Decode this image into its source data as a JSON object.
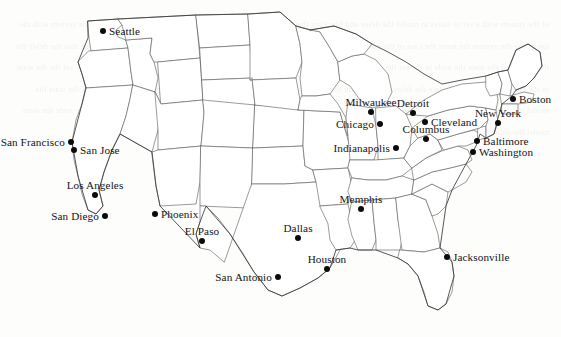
{
  "figure": {
    "type": "map",
    "region": "United States (contiguous 48 states)",
    "projection_note": "state boundary outline map",
    "marker_style": "filled black circle",
    "label_color": "#141414",
    "boundary_color": "#5c5c5c",
    "background_color": "#ffffff",
    "background_ghost_text": "faint mirrored bleed-through text from reverse page of scan, illegible"
  },
  "cities": [
    {
      "name": "Seattle",
      "x": 103,
      "y": 31,
      "label_side": "right"
    },
    {
      "name": "San Francisco",
      "x": 71,
      "y": 142,
      "label_side": "left"
    },
    {
      "name": "San Jose",
      "x": 74,
      "y": 150,
      "label_side": "right"
    },
    {
      "name": "Los Angeles",
      "x": 95,
      "y": 195,
      "label_side": "above"
    },
    {
      "name": "San Diego",
      "x": 105,
      "y": 216,
      "label_side": "left"
    },
    {
      "name": "Phoenix",
      "x": 155,
      "y": 214,
      "label_side": "right"
    },
    {
      "name": "El Paso",
      "x": 202,
      "y": 241,
      "label_side": "above"
    },
    {
      "name": "Dallas",
      "x": 298,
      "y": 238,
      "label_side": "above"
    },
    {
      "name": "San Antonio",
      "x": 278,
      "y": 277,
      "label_side": "left"
    },
    {
      "name": "Houston",
      "x": 327,
      "y": 269,
      "label_side": "above"
    },
    {
      "name": "Memphis",
      "x": 361,
      "y": 209,
      "label_side": "above"
    },
    {
      "name": "Jacksonville",
      "x": 447,
      "y": 257,
      "label_side": "right"
    },
    {
      "name": "Milwaukee",
      "x": 371,
      "y": 112,
      "label_side": "above"
    },
    {
      "name": "Chicago",
      "x": 380,
      "y": 124,
      "label_side": "left"
    },
    {
      "name": "Detroit",
      "x": 413,
      "y": 113,
      "label_side": "above"
    },
    {
      "name": "Cleveland",
      "x": 425,
      "y": 122,
      "label_side": "right"
    },
    {
      "name": "Columbus",
      "x": 426,
      "y": 139,
      "label_side": "above"
    },
    {
      "name": "Indianapolis",
      "x": 396,
      "y": 148,
      "label_side": "left"
    },
    {
      "name": "Boston",
      "x": 513,
      "y": 99,
      "label_side": "right"
    },
    {
      "name": "New York",
      "x": 498,
      "y": 123,
      "label_side": "above"
    },
    {
      "name": "Baltimore",
      "x": 477,
      "y": 141,
      "label_side": "right"
    },
    {
      "name": "Washington",
      "x": 473,
      "y": 152,
      "label_side": "right"
    }
  ],
  "ghost_text": "of the system with a set of states to model the delay and blocking that may occur the delay varies and the nodes in the way of the system with the use of the the system the more the case of the node in the form of the set and the and may to the the use of the model of the state that the delay the the system of the state the node in the set the model of the delay the use of the state set of the model and the node of the delay the set the the state in the model of node set the state the delay and the form the model of the node the use the set the the system and the the node of the state the model of the delay the use and the set of the in the state the node the model the delay of and set the system the form the use in the node the state model the delay"
}
